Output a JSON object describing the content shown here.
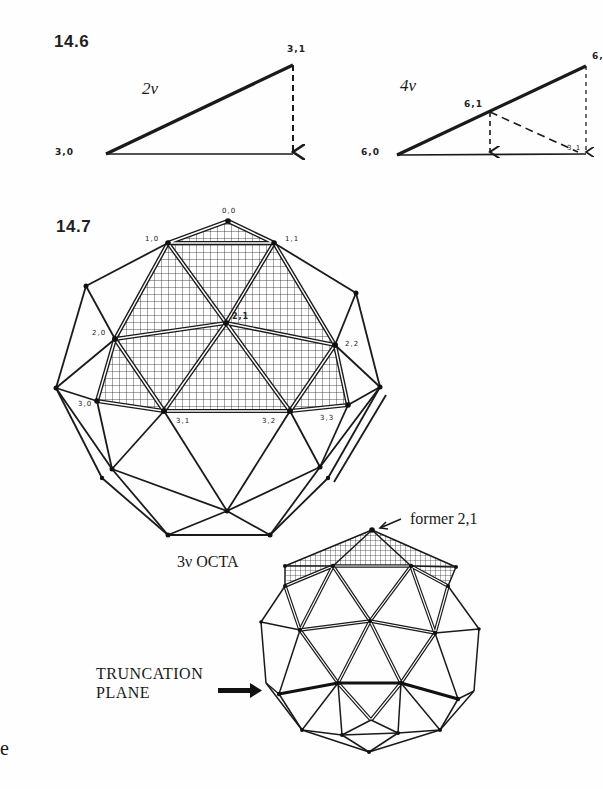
{
  "figures": {
    "fig_14_6": {
      "number": "14.6",
      "left_diagram": {
        "frequency_label": "2ν",
        "point_labels": {
          "base": "3,0",
          "apex": "3,1"
        }
      },
      "right_diagram": {
        "frequency_label": "4ν",
        "point_labels": {
          "base": "6,0",
          "mid": "6,1",
          "apex": "6,",
          "foot": "3,1"
        }
      }
    },
    "fig_14_7": {
      "number": "14.7",
      "dome_labels": {
        "n00": "0,0",
        "n10": "1,0",
        "n11": "1,1",
        "n20": "2,0",
        "n21": "2,1",
        "n22": "2,2",
        "n30": "3,0",
        "n31": "3,1",
        "n32": "3,2",
        "n33": "3,3"
      },
      "caption": "3ν OCTA",
      "annotation_pointer": "former 2,1",
      "truncation_label_line1": "TRUNCATION",
      "truncation_label_line2": "PLANE"
    },
    "margin_fragment": "e"
  },
  "colors": {
    "ink": "#1a1a1a",
    "paper": "#fefefe"
  }
}
